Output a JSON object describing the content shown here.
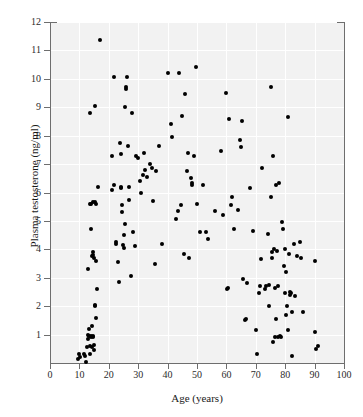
{
  "figure": {
    "caption_ghost": "",
    "background_color": "#f2f2f2",
    "point_color": "#000000",
    "axis_color": "#6e6e6e"
  },
  "chart_data": {
    "type": "scatter",
    "title": "",
    "xlabel": "Age (years)",
    "ylabel": "Plasma testosterone (ng/ml)",
    "xlim": [
      0,
      100
    ],
    "ylim": [
      0,
      12
    ],
    "xticks": [
      0,
      10,
      20,
      30,
      40,
      50,
      60,
      70,
      80,
      90,
      100
    ],
    "yticks": [
      1,
      2,
      3,
      4,
      5,
      6,
      7,
      8,
      9,
      10,
      11,
      12
    ],
    "grid": true,
    "legend": null,
    "series": [
      {
        "name": "subjects",
        "marker": "filled-circle",
        "color": "#000000",
        "points": [
          [
            9.5,
            0.15
          ],
          [
            10.0,
            0.3
          ],
          [
            10.3,
            0.2
          ],
          [
            11.5,
            0.3
          ],
          [
            12.0,
            0.25
          ],
          [
            12.4,
            0.05
          ],
          [
            12.6,
            0.55
          ],
          [
            12.8,
            0.85
          ],
          [
            13.0,
            1.0
          ],
          [
            13.2,
            1.2
          ],
          [
            13.3,
            0.95
          ],
          [
            13.5,
            0.6
          ],
          [
            13.6,
            0.3
          ],
          [
            13.8,
            0.9
          ],
          [
            14.0,
            0.95
          ],
          [
            14.2,
            1.3
          ],
          [
            14.3,
            0.55
          ],
          [
            14.5,
            0.9
          ],
          [
            14.6,
            0.95
          ],
          [
            14.8,
            0.45
          ],
          [
            15.0,
            0.65
          ],
          [
            15.2,
            2.0
          ],
          [
            15.4,
            2.05
          ],
          [
            15.6,
            1.6
          ],
          [
            16.0,
            2.6
          ],
          [
            13.0,
            3.3
          ],
          [
            14.3,
            3.75
          ],
          [
            14.5,
            3.9
          ],
          [
            14.6,
            3.8
          ],
          [
            15.0,
            3.7
          ],
          [
            15.6,
            3.6
          ],
          [
            14.0,
            4.7
          ],
          [
            13.5,
            5.6
          ],
          [
            14.0,
            5.6
          ],
          [
            14.6,
            5.65
          ],
          [
            15.3,
            5.65
          ],
          [
            15.6,
            5.6
          ],
          [
            16.2,
            6.2
          ],
          [
            13.6,
            8.8
          ],
          [
            15.3,
            9.05
          ],
          [
            17.0,
            11.35
          ],
          [
            21.0,
            7.3
          ],
          [
            21.2,
            6.1
          ],
          [
            21.6,
            6.25
          ],
          [
            21.8,
            10.05
          ],
          [
            22.4,
            4.2
          ],
          [
            22.6,
            4.25
          ],
          [
            23.0,
            3.55
          ],
          [
            23.5,
            2.85
          ],
          [
            23.8,
            7.75
          ],
          [
            24.0,
            7.35
          ],
          [
            24.2,
            6.15
          ],
          [
            24.3,
            6.2
          ],
          [
            24.5,
            5.3
          ],
          [
            24.6,
            5.55
          ],
          [
            24.8,
            4.15
          ],
          [
            25.0,
            4.05
          ],
          [
            25.2,
            4.5
          ],
          [
            25.4,
            4.9
          ],
          [
            25.6,
            9.0
          ],
          [
            25.8,
            9.65
          ],
          [
            26.0,
            9.7
          ],
          [
            26.3,
            10.05
          ],
          [
            26.5,
            7.65
          ],
          [
            26.8,
            6.2
          ],
          [
            27.0,
            5.75
          ],
          [
            27.4,
            3.05
          ],
          [
            28.0,
            8.8
          ],
          [
            28.4,
            4.6
          ],
          [
            29.0,
            4.1
          ],
          [
            29.4,
            7.3
          ],
          [
            30.0,
            7.2
          ],
          [
            30.6,
            6.4
          ],
          [
            31.0,
            6.0
          ],
          [
            31.6,
            6.6
          ],
          [
            32.0,
            7.4
          ],
          [
            32.4,
            6.8
          ],
          [
            33.0,
            6.55
          ],
          [
            34.0,
            7.0
          ],
          [
            34.6,
            6.85
          ],
          [
            35.0,
            5.7
          ],
          [
            35.6,
            3.5
          ],
          [
            36.0,
            6.75
          ],
          [
            37.0,
            7.65
          ],
          [
            38.0,
            4.2
          ],
          [
            40.0,
            10.2
          ],
          [
            41.0,
            8.4
          ],
          [
            41.6,
            7.95
          ],
          [
            43.0,
            5.05
          ],
          [
            43.4,
            5.35
          ],
          [
            44.0,
            10.2
          ],
          [
            44.6,
            5.55
          ],
          [
            45.0,
            8.7
          ],
          [
            45.6,
            3.85
          ],
          [
            46.0,
            9.45
          ],
          [
            46.6,
            6.75
          ],
          [
            47.0,
            7.4
          ],
          [
            47.4,
            3.7
          ],
          [
            48.0,
            6.5
          ],
          [
            48.2,
            6.35
          ],
          [
            48.4,
            6.25
          ],
          [
            49.0,
            7.3
          ],
          [
            49.6,
            10.4
          ],
          [
            50.0,
            5.6
          ],
          [
            51.0,
            4.6
          ],
          [
            52.0,
            6.25
          ],
          [
            53.0,
            4.6
          ],
          [
            53.6,
            4.35
          ],
          [
            56.0,
            5.35
          ],
          [
            58.0,
            7.45
          ],
          [
            59.0,
            5.2
          ],
          [
            60.0,
            9.5
          ],
          [
            60.2,
            2.6
          ],
          [
            60.6,
            2.65
          ],
          [
            61.0,
            8.6
          ],
          [
            61.6,
            5.55
          ],
          [
            62.0,
            5.85
          ],
          [
            62.6,
            4.7
          ],
          [
            64.0,
            5.4
          ],
          [
            64.6,
            7.85
          ],
          [
            65.0,
            7.6
          ],
          [
            65.4,
            8.5
          ],
          [
            65.8,
            2.95
          ],
          [
            66.4,
            1.5
          ],
          [
            66.6,
            1.55
          ],
          [
            67.0,
            2.8
          ],
          [
            68.0,
            6.15
          ],
          [
            69.0,
            4.65
          ],
          [
            70.0,
            1.15
          ],
          [
            70.4,
            0.3
          ],
          [
            71.0,
            2.45
          ],
          [
            71.4,
            2.7
          ],
          [
            71.6,
            3.65
          ],
          [
            72.0,
            6.85
          ],
          [
            73.0,
            2.6
          ],
          [
            73.4,
            2.7
          ],
          [
            74.0,
            4.55
          ],
          [
            74.4,
            2.75
          ],
          [
            74.6,
            2.0
          ],
          [
            75.0,
            9.7
          ],
          [
            75.2,
            5.85
          ],
          [
            75.4,
            3.7
          ],
          [
            75.6,
            3.9
          ],
          [
            75.8,
            0.75
          ],
          [
            76.0,
            7.3
          ],
          [
            76.2,
            4.0
          ],
          [
            76.4,
            2.65
          ],
          [
            76.6,
            0.9
          ],
          [
            76.8,
            1.55
          ],
          [
            77.0,
            6.25
          ],
          [
            77.2,
            3.95
          ],
          [
            77.4,
            2.7
          ],
          [
            77.6,
            0.9
          ],
          [
            78.0,
            6.35
          ],
          [
            78.2,
            0.95
          ],
          [
            78.6,
            0.9
          ],
          [
            79.0,
            4.95
          ],
          [
            79.4,
            4.7
          ],
          [
            79.6,
            3.4
          ],
          [
            79.8,
            2.45
          ],
          [
            80.0,
            4.0
          ],
          [
            80.2,
            3.2
          ],
          [
            80.4,
            1.7
          ],
          [
            80.6,
            2.0
          ],
          [
            80.8,
            1.15
          ],
          [
            81.0,
            8.65
          ],
          [
            81.4,
            3.85
          ],
          [
            81.6,
            2.5
          ],
          [
            81.8,
            2.4
          ],
          [
            82.0,
            2.45
          ],
          [
            82.2,
            1.8
          ],
          [
            82.4,
            0.25
          ],
          [
            83.0,
            4.2
          ],
          [
            83.4,
            2.35
          ],
          [
            84.0,
            3.75
          ],
          [
            85.0,
            4.25
          ],
          [
            85.4,
            3.7
          ],
          [
            86.0,
            1.8
          ],
          [
            90.0,
            3.6
          ],
          [
            90.2,
            1.1
          ],
          [
            90.6,
            0.5
          ],
          [
            91.0,
            0.6
          ]
        ]
      }
    ]
  }
}
